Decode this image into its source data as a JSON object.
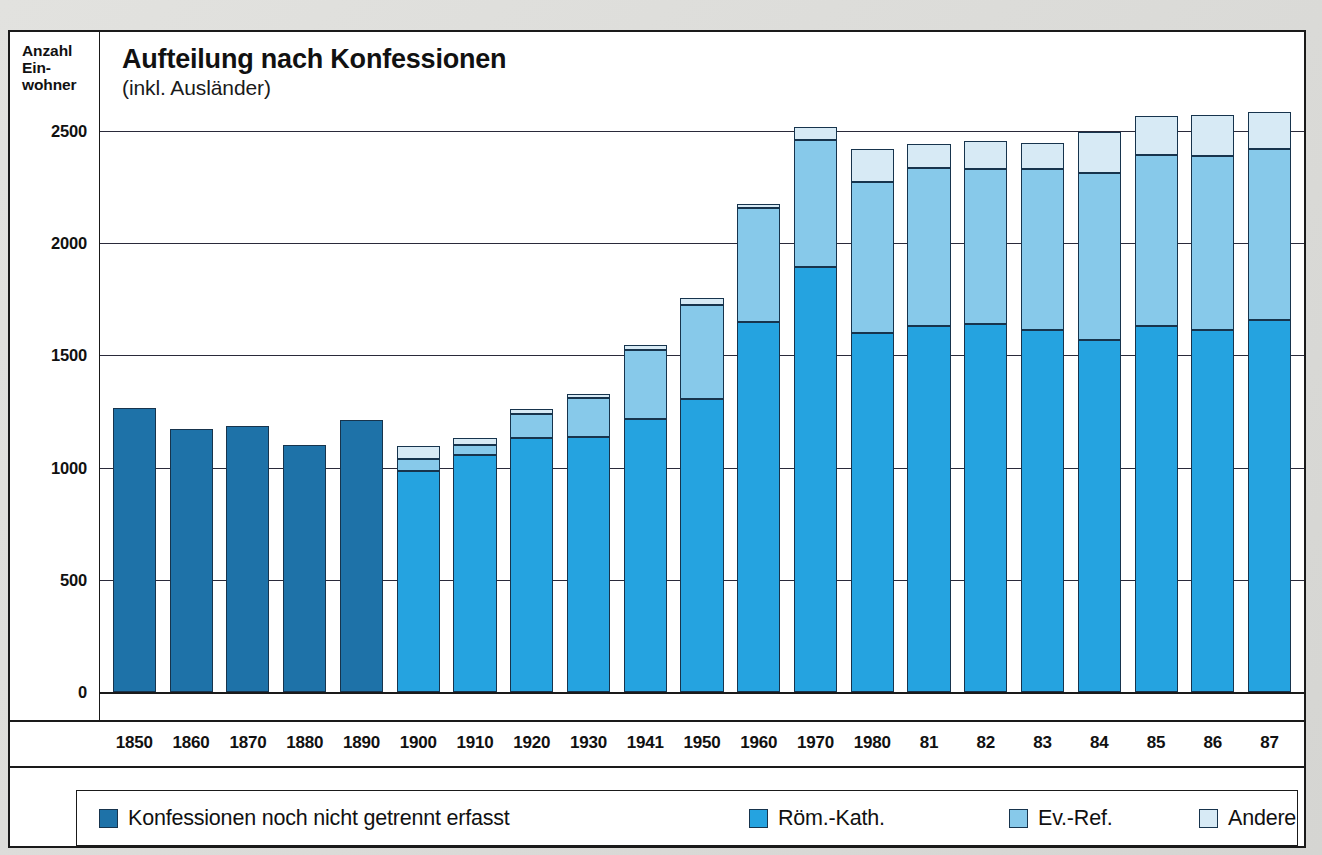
{
  "header": {
    "y_axis_title_lines": [
      "Anzahl",
      "Ein-",
      "wohner"
    ],
    "title": "Aufteilung nach Konfessionen",
    "subtitle": "(inkl. Ausländer)"
  },
  "legend": {
    "items": [
      {
        "key": "notsplit",
        "label": "Konfessionen noch nicht getrennt erfasst",
        "color": "#1e72a8"
      },
      {
        "key": "kath",
        "label": "Röm.-Kath.",
        "color": "#25a3e0"
      },
      {
        "key": "ev",
        "label": "Ev.-Ref.",
        "color": "#87c9ea"
      },
      {
        "key": "andere",
        "label": "Andere",
        "color": "#d7eaf5"
      }
    ]
  },
  "chart_data": {
    "type": "bar",
    "subtype": "stacked",
    "title": "Aufteilung nach Konfessionen",
    "subtitle": "(inkl. Ausländer)",
    "xlabel": "",
    "ylabel": "Anzahl Einwohner",
    "ylim": [
      0,
      2700
    ],
    "yticks": [
      0,
      500,
      1000,
      1500,
      2000,
      2500
    ],
    "ytick_labels": [
      "0",
      "500",
      "1000",
      "1500",
      "2000",
      "2500"
    ],
    "grid": true,
    "legend_position": "bottom",
    "categories": [
      "1850",
      "1860",
      "1870",
      "1880",
      "1890",
      "1900",
      "1910",
      "1920",
      "1930",
      "1941",
      "1950",
      "1960",
      "1970",
      "1980",
      "81",
      "82",
      "83",
      "84",
      "85",
      "86",
      "87"
    ],
    "series": [
      {
        "name": "Konfessionen noch nicht getrennt erfasst",
        "color": "#1e72a8",
        "values": [
          1265,
          1170,
          1185,
          1100,
          1210,
          0,
          0,
          0,
          0,
          0,
          0,
          0,
          0,
          0,
          0,
          0,
          0,
          0,
          0,
          0,
          0
        ]
      },
      {
        "name": "Röm.-Kath.",
        "color": "#25a3e0",
        "values": [
          0,
          0,
          0,
          0,
          0,
          985,
          1055,
          1130,
          1135,
          1215,
          1305,
          1650,
          1895,
          1600,
          1630,
          1640,
          1615,
          1570,
          1630,
          1615,
          1660
        ]
      },
      {
        "name": "Ev.-Ref.",
        "color": "#87c9ea",
        "values": [
          0,
          0,
          0,
          0,
          0,
          55,
          45,
          110,
          175,
          310,
          420,
          505,
          565,
          675,
          705,
          690,
          715,
          745,
          765,
          775,
          760
        ]
      },
      {
        "name": "Andere",
        "color": "#d7eaf5",
        "values": [
          0,
          0,
          0,
          0,
          0,
          55,
          30,
          20,
          20,
          20,
          30,
          20,
          60,
          145,
          105,
          125,
          115,
          180,
          170,
          180,
          165
        ]
      }
    ],
    "totals": [
      1265,
      1170,
      1185,
      1100,
      1210,
      1095,
      1130,
      1260,
      1330,
      1545,
      1755,
      2175,
      2520,
      2420,
      2440,
      2455,
      2445,
      2495,
      2565,
      2570,
      2585
    ]
  }
}
